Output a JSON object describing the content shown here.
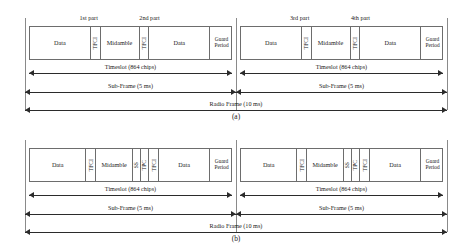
{
  "figure": {
    "panels": [
      {
        "id": "a",
        "caption": "(a)",
        "part_labels": [
          "1st part",
          "2nd part",
          "3rd part",
          "4th part"
        ],
        "subframes": [
          {
            "cells": [
              {
                "label": "Data",
                "orient": "horizontal"
              },
              {
                "label": "TFCI",
                "orient": "vertical"
              },
              {
                "label": "Midamble",
                "orient": "horizontal"
              },
              {
                "label": "TFCI",
                "orient": "vertical"
              },
              {
                "label": "Data",
                "orient": "horizontal"
              },
              {
                "label": "Guard Period",
                "orient": "horizontal"
              }
            ],
            "timeslot_label": "Timeslot (864 chips)",
            "subframe_label": "Sub-Frame (5 ms)"
          },
          {
            "cells": [
              {
                "label": "Data",
                "orient": "horizontal"
              },
              {
                "label": "TFCI",
                "orient": "vertical"
              },
              {
                "label": "Midamble",
                "orient": "horizontal"
              },
              {
                "label": "TFCI",
                "orient": "vertical"
              },
              {
                "label": "Data",
                "orient": "horizontal"
              },
              {
                "label": "Guard Period",
                "orient": "horizontal"
              }
            ],
            "timeslot_label": "Timeslot (864 chips)",
            "subframe_label": "Sub-Frame (5 ms)"
          }
        ],
        "radio_frame_label": "Radio Frame (10 ms)"
      },
      {
        "id": "b",
        "caption": "(b)",
        "part_labels": [],
        "subframes": [
          {
            "cells": [
              {
                "label": "Data",
                "orient": "horizontal"
              },
              {
                "label": "TFCI",
                "orient": "vertical"
              },
              {
                "label": "Midamble",
                "orient": "horizontal"
              },
              {
                "label": "SS",
                "orient": "vertical"
              },
              {
                "label": "TPC",
                "orient": "vertical"
              },
              {
                "label": "TFCI",
                "orient": "vertical"
              },
              {
                "label": "Data",
                "orient": "horizontal"
              },
              {
                "label": "Guard Period",
                "orient": "horizontal"
              }
            ],
            "timeslot_label": "Timeslot (864 chips)",
            "subframe_label": "Sub-Frame (5 ms)"
          },
          {
            "cells": [
              {
                "label": "Data",
                "orient": "horizontal"
              },
              {
                "label": "TFCI",
                "orient": "vertical"
              },
              {
                "label": "Midamble",
                "orient": "horizontal"
              },
              {
                "label": "SS",
                "orient": "vertical"
              },
              {
                "label": "TPC",
                "orient": "vertical"
              },
              {
                "label": "TFCI",
                "orient": "vertical"
              },
              {
                "label": "Data",
                "orient": "horizontal"
              },
              {
                "label": "Guard Period",
                "orient": "horizontal"
              }
            ],
            "timeslot_label": "Timeslot (864 chips)",
            "subframe_label": "Sub-Frame (5 ms)"
          }
        ],
        "radio_frame_label": "Radio Frame (10 ms)"
      }
    ]
  },
  "layout": {
    "cell_widths_a": [
      56,
      9,
      36,
      9,
      56,
      21
    ],
    "cell_widths_b": [
      52,
      9,
      34,
      7,
      8,
      9,
      47,
      21
    ]
  },
  "colors": {
    "box_stroke": "#6d6d6d",
    "arrow": "#2b2b2b",
    "rail": "#8a8a8a",
    "background": "#ffffff"
  }
}
